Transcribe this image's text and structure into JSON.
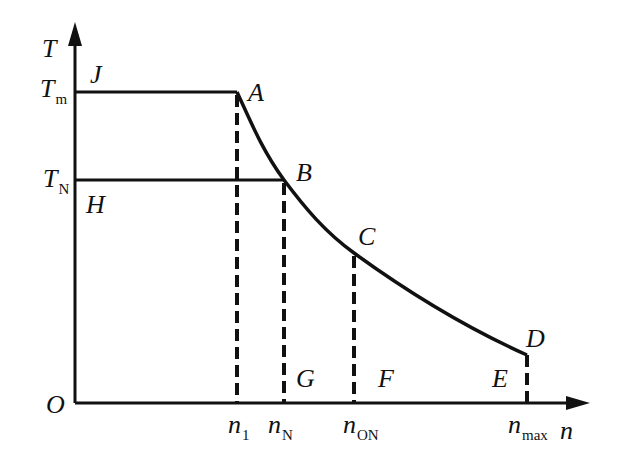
{
  "diagram": {
    "type": "torque-speed characteristic",
    "axes": {
      "y_label": "T",
      "x_label": "n",
      "origin_label": "O"
    },
    "y_ticks": [
      {
        "main": "T",
        "sub": "m"
      },
      {
        "main": "T",
        "sub": "N"
      }
    ],
    "x_ticks": [
      {
        "main": "n",
        "sub": "1"
      },
      {
        "main": "n",
        "sub": "N"
      },
      {
        "main": "n",
        "sub": "ON"
      },
      {
        "main": "n",
        "sub": "max"
      }
    ],
    "points": {
      "J": "J",
      "A": "A",
      "H": "H",
      "B": "B",
      "C": "C",
      "D": "D",
      "G": "G",
      "F": "F",
      "E": "E"
    },
    "colors": {
      "line": "#111111",
      "background": "#ffffff"
    }
  }
}
